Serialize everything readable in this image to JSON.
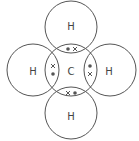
{
  "diagram": {
    "atoms": [
      {
        "id": "carbon",
        "label": "C",
        "cx": 71,
        "cy": 70
      },
      {
        "id": "h-top",
        "label": "H",
        "cx": 71,
        "cy": 27
      },
      {
        "id": "h-bottom",
        "label": "H",
        "cx": 71,
        "cy": 113
      },
      {
        "id": "h-left",
        "label": "H",
        "cx": 33,
        "cy": 70
      },
      {
        "id": "h-right",
        "label": "H",
        "cx": 110,
        "cy": 70
      }
    ],
    "radius": 26,
    "bonds": [
      {
        "position": "top",
        "electrons": [
          {
            "type": "dot",
            "x": 68,
            "y": 49
          },
          {
            "type": "cross",
            "x": 75,
            "y": 49
          }
        ]
      },
      {
        "position": "bottom",
        "electrons": [
          {
            "type": "cross",
            "x": 68,
            "y": 93
          },
          {
            "type": "dot",
            "x": 75,
            "y": 93
          }
        ]
      },
      {
        "position": "left",
        "electrons": [
          {
            "type": "cross",
            "x": 53,
            "y": 66
          },
          {
            "type": "dot",
            "x": 53,
            "y": 74
          }
        ]
      },
      {
        "position": "right",
        "electrons": [
          {
            "type": "dot",
            "x": 90,
            "y": 66
          },
          {
            "type": "cross",
            "x": 90,
            "y": 74
          }
        ]
      }
    ],
    "colors": {
      "stroke": "#555555",
      "text": "#444444"
    }
  }
}
